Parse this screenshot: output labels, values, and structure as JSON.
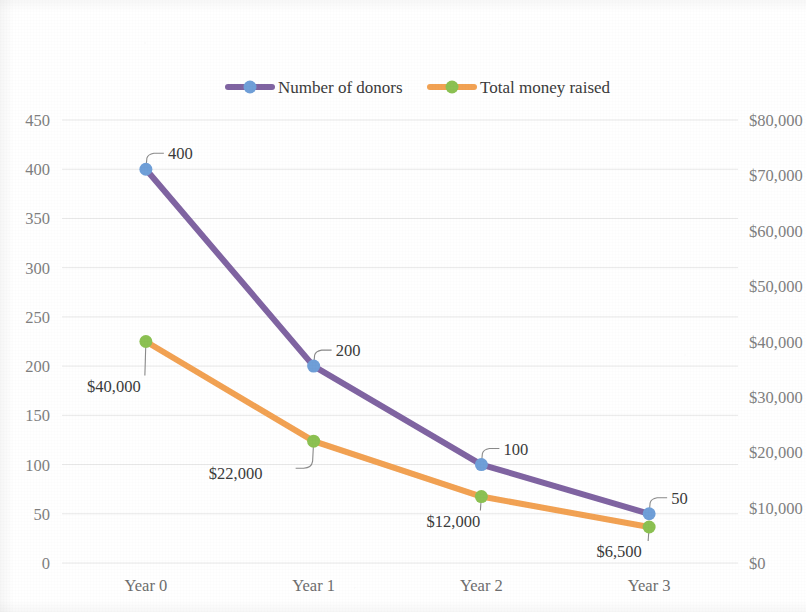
{
  "chart_data": {
    "type": "line",
    "title": "",
    "subtitle": "",
    "xlabel": "",
    "ylabel": "",
    "categories": [
      "Year 0",
      "Year 1",
      "Year 2",
      "Year 3"
    ],
    "grid": true,
    "legend_position": "top",
    "series": [
      {
        "name": "Number of donors",
        "axis": "left",
        "color": "#8064a2",
        "marker_color": "#6f9fd8",
        "values": [
          400,
          200,
          100,
          50
        ],
        "data_labels": [
          "400",
          "200",
          "100",
          "50"
        ]
      },
      {
        "name": "Total money raised",
        "axis": "right",
        "color": "#f2a253",
        "marker_color": "#8cc152",
        "values": [
          40000,
          22000,
          12000,
          6500
        ],
        "data_labels": [
          "$40,000",
          "$22,000",
          "$12,000",
          "$6,500"
        ]
      }
    ],
    "left_axis": {
      "min": 0,
      "max": 450,
      "step": 50,
      "ticks": [
        "0",
        "50",
        "100",
        "150",
        "200",
        "250",
        "300",
        "350",
        "400",
        "450"
      ],
      "tick_values": [
        0,
        50,
        100,
        150,
        200,
        250,
        300,
        350,
        400,
        450
      ]
    },
    "right_axis": {
      "min": 0,
      "max": 80000,
      "step": 10000,
      "ticks": [
        "$0",
        "$10,000",
        "$20,000",
        "$30,000",
        "$40,000",
        "$50,000",
        "$60,000",
        "$70,000",
        "$80,000"
      ],
      "tick_values": [
        0,
        10000,
        20000,
        30000,
        40000,
        50000,
        60000,
        70000,
        80000
      ]
    }
  },
  "legend": {
    "items": [
      {
        "label": "Number of donors",
        "line_color": "#8064a2",
        "marker_color": "#6f9fd8"
      },
      {
        "label": "Total money raised",
        "line_color": "#f2a253",
        "marker_color": "#8cc152"
      }
    ]
  },
  "colors": {
    "donors_line": "#8064a2",
    "donors_marker": "#6f9fd8",
    "money_line": "#f2a253",
    "money_marker": "#8cc152",
    "gridline": "#e8e8e8",
    "axis_text": "#7f7f7f",
    "label_text": "#3b3b3b",
    "background": "#ffffff"
  }
}
